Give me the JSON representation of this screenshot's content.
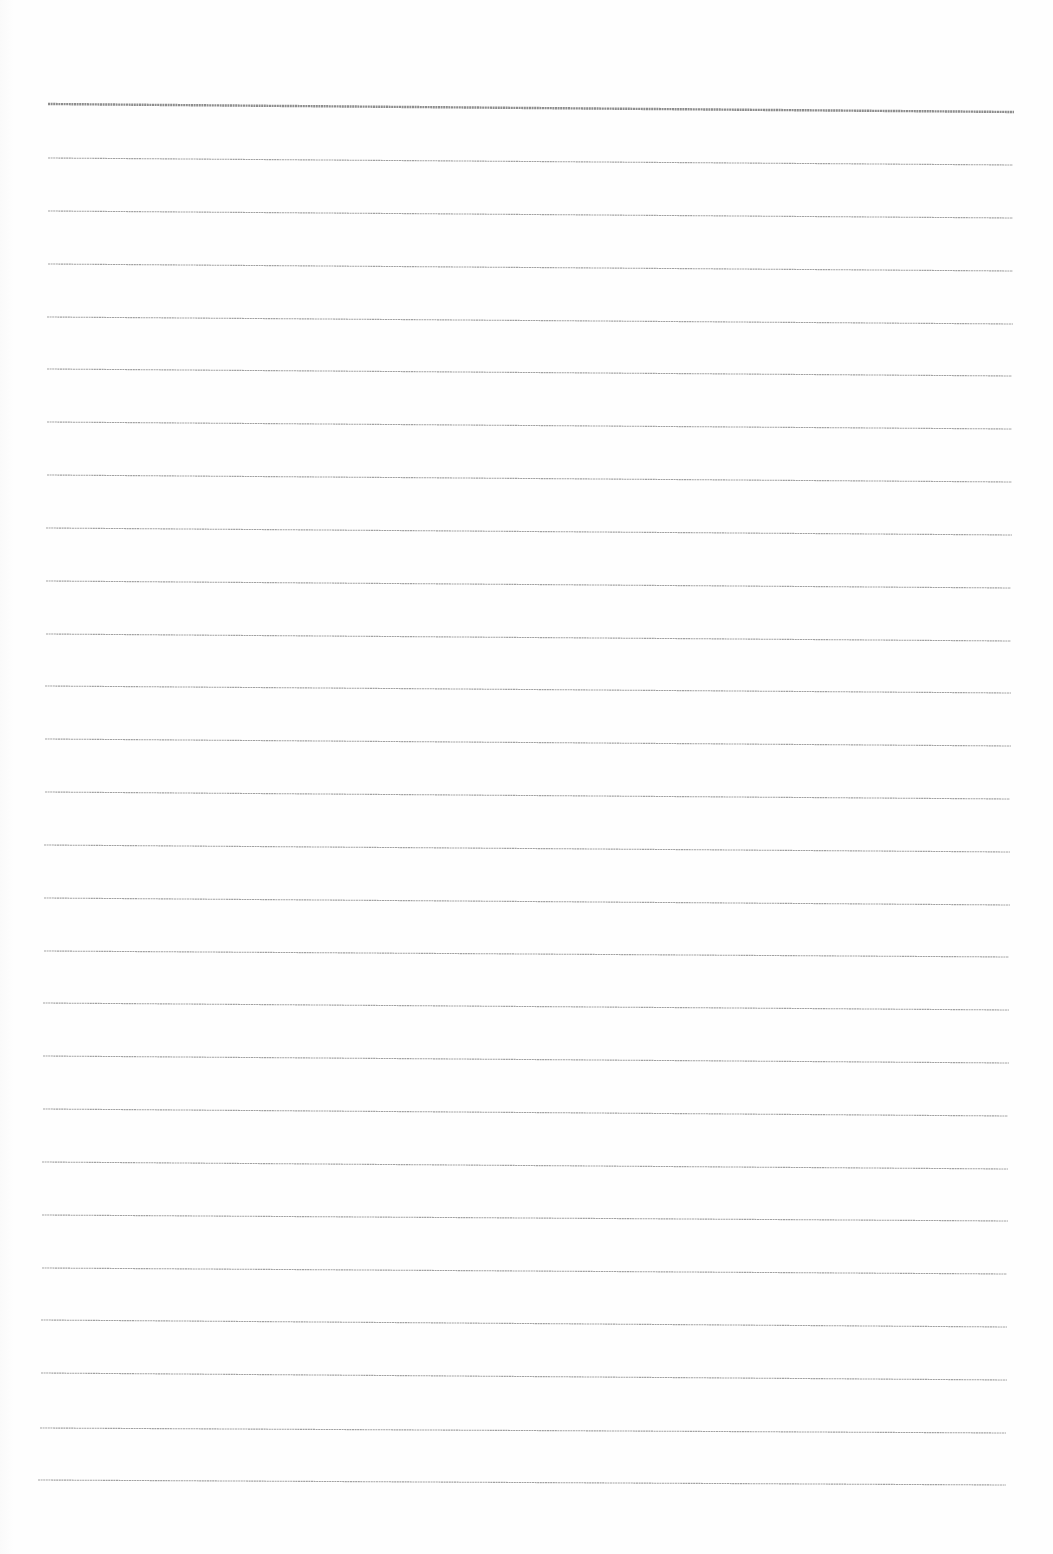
{
  "document": {
    "type": "ruled-paper",
    "background_color": "#fefefe",
    "rule_color": "#8a8a8a",
    "header_rule_color": "#7a7a7a",
    "rules": [
      {
        "x1": 48,
        "y1": 104,
        "x2": 1014,
        "y2": 112,
        "width": 2.4,
        "kind": "header"
      },
      {
        "x1": 48,
        "y1": 158,
        "x2": 1013,
        "y2": 165,
        "width": 1.1
      },
      {
        "x1": 48,
        "y1": 211,
        "x2": 1013,
        "y2": 218,
        "width": 1.1
      },
      {
        "x1": 48,
        "y1": 264,
        "x2": 1013,
        "y2": 271,
        "width": 1.1
      },
      {
        "x1": 47,
        "y1": 317,
        "x2": 1013,
        "y2": 324,
        "width": 1.1
      },
      {
        "x1": 47,
        "y1": 369,
        "x2": 1012,
        "y2": 376,
        "width": 1.1
      },
      {
        "x1": 47,
        "y1": 422,
        "x2": 1012,
        "y2": 429,
        "width": 1.1
      },
      {
        "x1": 47,
        "y1": 475,
        "x2": 1012,
        "y2": 482,
        "width": 1.1
      },
      {
        "x1": 46,
        "y1": 528,
        "x2": 1012,
        "y2": 535,
        "width": 1.1
      },
      {
        "x1": 46,
        "y1": 581,
        "x2": 1011,
        "y2": 588,
        "width": 1.1
      },
      {
        "x1": 46,
        "y1": 634,
        "x2": 1011,
        "y2": 641,
        "width": 1.1
      },
      {
        "x1": 45,
        "y1": 686,
        "x2": 1011,
        "y2": 693,
        "width": 1.1
      },
      {
        "x1": 45,
        "y1": 739,
        "x2": 1011,
        "y2": 746,
        "width": 1.1
      },
      {
        "x1": 45,
        "y1": 792,
        "x2": 1010,
        "y2": 799,
        "width": 1.1
      },
      {
        "x1": 44,
        "y1": 845,
        "x2": 1010,
        "y2": 852,
        "width": 1.1
      },
      {
        "x1": 44,
        "y1": 898,
        "x2": 1010,
        "y2": 905,
        "width": 1.1
      },
      {
        "x1": 44,
        "y1": 951,
        "x2": 1009,
        "y2": 957,
        "width": 1.1
      },
      {
        "x1": 43,
        "y1": 1003,
        "x2": 1009,
        "y2": 1010,
        "width": 1.1
      },
      {
        "x1": 43,
        "y1": 1056,
        "x2": 1009,
        "y2": 1063,
        "width": 1.1
      },
      {
        "x1": 43,
        "y1": 1109,
        "x2": 1008,
        "y2": 1116,
        "width": 1.1
      },
      {
        "x1": 42,
        "y1": 1162,
        "x2": 1008,
        "y2": 1169,
        "width": 1.1
      },
      {
        "x1": 42,
        "y1": 1215,
        "x2": 1008,
        "y2": 1221,
        "width": 1.1
      },
      {
        "x1": 42,
        "y1": 1268,
        "x2": 1007,
        "y2": 1274,
        "width": 1.1
      },
      {
        "x1": 41,
        "y1": 1320,
        "x2": 1007,
        "y2": 1327,
        "width": 1.1
      },
      {
        "x1": 41,
        "y1": 1373,
        "x2": 1007,
        "y2": 1380,
        "width": 1.1
      },
      {
        "x1": 40,
        "y1": 1428,
        "x2": 1006,
        "y2": 1433,
        "width": 1.1
      },
      {
        "x1": 38,
        "y1": 1480,
        "x2": 1006,
        "y2": 1485,
        "width": 1.1
      }
    ]
  }
}
